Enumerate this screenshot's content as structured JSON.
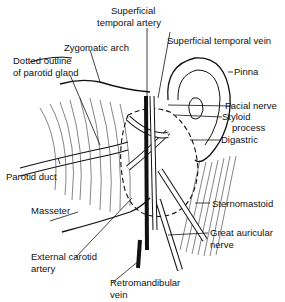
{
  "diagram": {
    "labels": {
      "sup_temp_artery_1": "Superficial",
      "sup_temp_artery_2": "temporal artery",
      "sup_temp_vein": "Superficial temporal vein",
      "zygomatic_arch": "Zygomatic arch",
      "dotted_outline_1": "Dotted outline",
      "dotted_outline_2": "of parotid gland",
      "pinna": "Pinna",
      "facial_nerve": "Facial nerve",
      "styloid_1": "Styloid",
      "styloid_2": "process",
      "digastric": "Digastric",
      "parotid_duct": "Parotid duct",
      "sternomastoid": "Sternomastoid",
      "masseter": "Masseter",
      "great_auricular_1": "Great auricular",
      "great_auricular_2": "nerve",
      "external_carotid_1": "External carotid",
      "external_carotid_2": "artery",
      "retromandibular_1": "Retromandibular",
      "retromandibular_2": "vein"
    }
  }
}
